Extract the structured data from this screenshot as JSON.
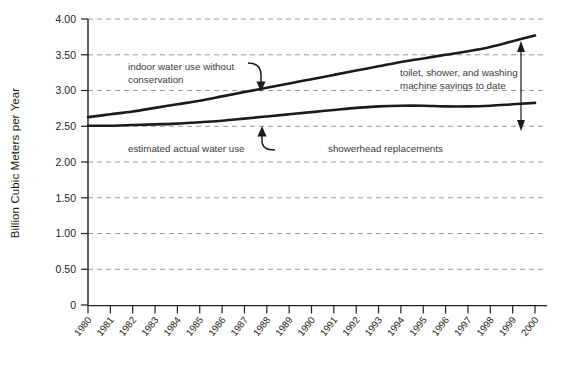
{
  "chart_data": {
    "type": "line",
    "title": "",
    "xlabel": "",
    "ylabel": "Billion Cubic Meters per Year",
    "ylim": [
      0,
      4.0
    ],
    "ytick_labels": [
      "0",
      "0.50",
      "1.00",
      "1.50",
      "2.00",
      "2.50",
      "3.00",
      "3.50",
      "4.00"
    ],
    "ytick_values": [
      0,
      0.5,
      1.0,
      1.5,
      2.0,
      2.5,
      3.0,
      3.5,
      4.0
    ],
    "grid": true,
    "legend_position": "none",
    "x": [
      1980,
      1981,
      1982,
      1983,
      1984,
      1985,
      1986,
      1987,
      1988,
      1989,
      1990,
      1991,
      1992,
      1993,
      1994,
      1995,
      1996,
      1997,
      1998,
      1999,
      2000
    ],
    "categories": [
      "1980",
      "1981",
      "1982",
      "1983",
      "1984",
      "1985",
      "1986",
      "1987",
      "1988",
      "1989",
      "1990",
      "1991",
      "1992",
      "1993",
      "1994",
      "1995",
      "1996",
      "1997",
      "1998",
      "1999",
      "2000"
    ],
    "series": [
      {
        "name": "indoor water use without conservation",
        "values": [
          2.63,
          2.67,
          2.71,
          2.76,
          2.81,
          2.86,
          2.92,
          2.98,
          3.04,
          3.1,
          3.16,
          3.22,
          3.28,
          3.34,
          3.4,
          3.45,
          3.5,
          3.55,
          3.61,
          3.69,
          3.77
        ]
      },
      {
        "name": "estimated actual water use",
        "values": [
          2.51,
          2.51,
          2.52,
          2.53,
          2.54,
          2.56,
          2.58,
          2.61,
          2.64,
          2.67,
          2.7,
          2.73,
          2.76,
          2.78,
          2.79,
          2.79,
          2.78,
          2.78,
          2.79,
          2.81,
          2.83
        ]
      }
    ],
    "annotations": [
      {
        "id": "upper-series-label",
        "text_lines": [
          "indoor water use without",
          "conservation"
        ],
        "points_to": "indoor water use without conservation"
      },
      {
        "id": "lower-series-label",
        "text_lines": [
          "estimated actual water use"
        ],
        "points_to": "estimated actual water use"
      },
      {
        "id": "savings-label",
        "text_lines": [
          "toilet, shower, and washing",
          "machine savings to date"
        ],
        "points_to": "gap between series at 2000"
      },
      {
        "id": "showerhead-label",
        "text_lines": [
          "showerhead replacements"
        ],
        "points_to": ""
      }
    ],
    "colors": {
      "line": "#1b1b1b",
      "grid": "#9a9a9a",
      "axis": "#231f20",
      "text": "#231f20",
      "annotation_text": "#3a3a3a",
      "background": "#ffffff"
    }
  }
}
